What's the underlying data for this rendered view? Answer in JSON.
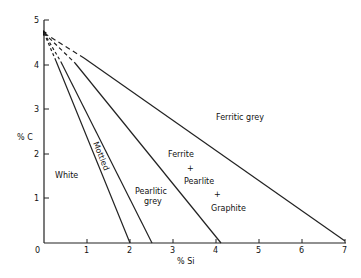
{
  "diagram": {
    "xlabel": "% Si",
    "ylabel": "% C",
    "x_ticks": [
      "0",
      "1",
      "2",
      "3",
      "4",
      "5",
      "6",
      "7"
    ],
    "y_ticks": [
      "1",
      "2",
      "3",
      "4",
      "5"
    ],
    "regions": {
      "white": "White",
      "mottled": "Mottled",
      "pearlitic_grey_1": "Pearlitic",
      "pearlitic_grey_2": "grey",
      "ferrite": "Ferrite",
      "plus1": "+",
      "pearlite": "Pearlite",
      "plus2": "+",
      "graphite": "Graphite",
      "ferritic_grey": "Ferritic grey"
    },
    "boundaries": [
      {
        "from": [
          0,
          4.7
        ],
        "to": [
          2.0,
          0
        ]
      },
      {
        "from": [
          0,
          4.7
        ],
        "to": [
          2.5,
          0
        ]
      },
      {
        "from": [
          0,
          4.7
        ],
        "to": [
          4.1,
          0
        ]
      },
      {
        "from": [
          0,
          4.7
        ],
        "to": [
          7.0,
          0
        ]
      }
    ]
  }
}
